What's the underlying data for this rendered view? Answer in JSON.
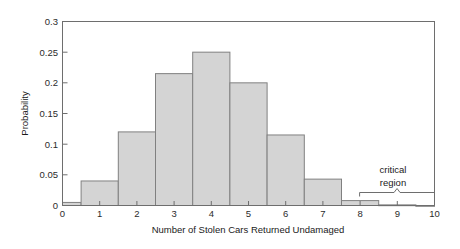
{
  "chart_data": {
    "type": "bar",
    "title": "",
    "subtitle": "",
    "xlabel": "Number of Stolen Cars Returned Undamaged",
    "ylabel": "Probability",
    "categories": [
      "0",
      "1",
      "2",
      "3",
      "4",
      "5",
      "6",
      "7",
      "8",
      "9",
      "10"
    ],
    "values": [
      0.005,
      0.04,
      0.12,
      0.215,
      0.25,
      0.2,
      0.115,
      0.043,
      0.008,
      0.001,
      0.0
    ],
    "xlim": [
      0,
      10
    ],
    "ylim": [
      0,
      0.3
    ],
    "xticks": [
      "0",
      "1",
      "2",
      "3",
      "4",
      "5",
      "6",
      "7",
      "8",
      "9",
      "10"
    ],
    "yticks": [
      "0",
      "0.05",
      "0.1",
      "0.15",
      "0.2",
      "0.25",
      "0.3"
    ],
    "ytick_values": [
      0,
      0.05,
      0.1,
      0.15,
      0.2,
      0.25,
      0.3
    ],
    "grid": false,
    "legend": null,
    "bar_fill_color": "#d4d4d4",
    "bar_edge_color": "#808080",
    "axis_color": "#6e6e6e",
    "annotations": [
      {
        "name": "critical-region",
        "text_line1": "critical",
        "text_line2": "region",
        "brace_from": 8,
        "brace_to": 10
      }
    ]
  }
}
